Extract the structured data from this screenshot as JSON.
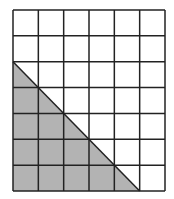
{
  "diagram": {
    "type": "grid-with-shaded-triangle",
    "grid": {
      "columns": 6,
      "rows": 7,
      "origin_x": 13,
      "origin_y": 10,
      "width": 152,
      "height": 181,
      "line_color": "#222222",
      "background": "#ffffff"
    },
    "shaded_triangle": {
      "fill": "#b3b3b3",
      "vertices_grid_units": [
        [
          0,
          2
        ],
        [
          0,
          7
        ],
        [
          5,
          7
        ]
      ],
      "description": "Right triangle in lower-left; legs of 5 units (vertical) and 5 units (horizontal)"
    }
  }
}
